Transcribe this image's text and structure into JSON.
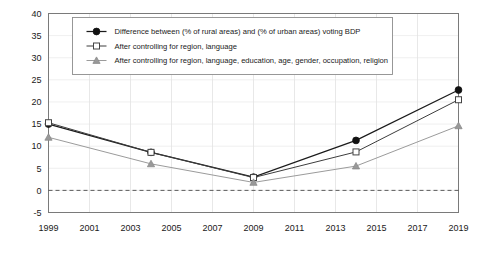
{
  "chart_data": {
    "type": "line",
    "title": "",
    "xlabel": "",
    "ylabel": "",
    "x": [
      1999,
      2004,
      2009,
      2014,
      2019
    ],
    "xlim": [
      1999,
      2019
    ],
    "ylim": [
      -5,
      40
    ],
    "x_ticks": [
      "1999",
      "2001",
      "2003",
      "2005",
      "2007",
      "2009",
      "2011",
      "2013",
      "2015",
      "2017",
      "2019"
    ],
    "y_ticks": [
      "40",
      "35",
      "30",
      "25",
      "20",
      "15",
      "10",
      "5",
      "0",
      "-5"
    ],
    "grid": true,
    "legend_position": "top-left-inside",
    "zero_reference_line": 0,
    "series": [
      {
        "name": "Difference between (% of rural areas) and (% of urban areas) voting BDP",
        "marker": "filled-circle",
        "values": [
          15.0,
          8.6,
          3.0,
          11.3,
          22.7
        ]
      },
      {
        "name": "After controlling for region, language",
        "marker": "open-square",
        "values": [
          15.3,
          8.6,
          2.9,
          8.7,
          20.5
        ]
      },
      {
        "name": "After controlling for region, language, education, age, gender, occupation, religion",
        "marker": "filled-triangle",
        "values": [
          12.0,
          6.0,
          1.8,
          5.5,
          14.6
        ]
      }
    ]
  },
  "colors": {
    "series_a": "#111111",
    "series_b": "#444444",
    "series_c": "#999999",
    "grid": "#e2e2e2",
    "axis": "#7a7a7a",
    "background": "#ffffff"
  }
}
